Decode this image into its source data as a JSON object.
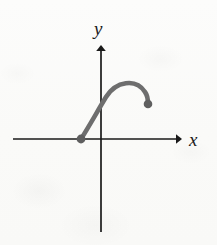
{
  "figure": {
    "title": "",
    "background_color": "#fbfbf9",
    "axis_color": "#1a1a1a",
    "curve_color": "#6e6e6e",
    "point_color": "#5f5f5f"
  },
  "axes": {
    "x": {
      "label": "x",
      "label_position": {
        "x": 196,
        "y": 140
      },
      "line": {
        "x1": 13,
        "y1": 139,
        "x2": 180,
        "y2": 139
      },
      "arrow": "right"
    },
    "y": {
      "label": "y",
      "label_position": {
        "x": 101,
        "y": 31
      },
      "line": {
        "x1": 101,
        "y1": 232,
        "x2": 101,
        "y2": 45
      },
      "arrow": "up"
    },
    "origin": {
      "x": 101,
      "y": 139
    }
  },
  "chart_data": {
    "type": "line",
    "title": "",
    "xlabel": "x",
    "ylabel": "y",
    "grid": false,
    "legend": null,
    "curve_path": "M 81 139 C 88 128, 97 112, 106 97 C 116 81, 136 78, 145 92 C 148 96, 148 100, 148 104",
    "points": [
      {
        "name": "left-endpoint",
        "x": 81,
        "y": 139,
        "style": "filled-dot",
        "on_axis": "x"
      },
      {
        "name": "right-endpoint",
        "x": 148,
        "y": 104,
        "style": "filled-dot",
        "on_axis": null
      }
    ],
    "peak": {
      "x": 127,
      "y": 83
    }
  }
}
